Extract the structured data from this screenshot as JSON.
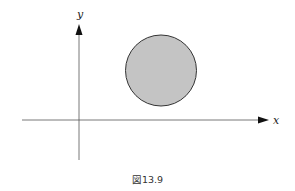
{
  "figure": {
    "caption": "図13.9",
    "axes": {
      "x_label": "x",
      "y_label": "y",
      "color": "#555555"
    },
    "circle": {
      "fill": "#c4c4c4",
      "stroke": "#333333",
      "description": "shaded disk in the first quadrant"
    }
  }
}
